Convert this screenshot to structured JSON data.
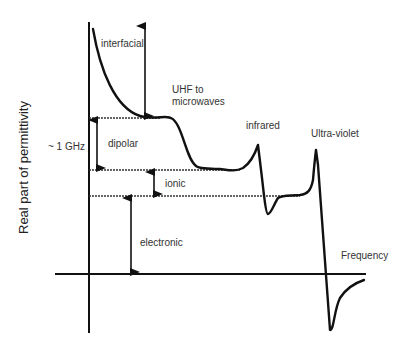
{
  "diagram": {
    "type": "dielectric-permittivity-spectrum",
    "y_axis_label": "Real part of permittivity",
    "x_axis_label": "Frequency",
    "marker_label": "~ 1 GHz",
    "regions": [
      {
        "name": "interfacial",
        "label": "interfacial"
      },
      {
        "name": "dipolar",
        "label": "dipolar"
      },
      {
        "name": "ionic",
        "label": "ionic"
      },
      {
        "name": "electronic",
        "label": "electronic"
      }
    ],
    "band_labels": {
      "uhf": "UHF to microwaves",
      "uhf_line1": "UHF to",
      "uhf_line2": "microwaves",
      "infrared": "infrared",
      "ultraviolet": "Ultra-violet"
    },
    "colors": {
      "line": "#111111",
      "text": "#333333",
      "background": "#ffffff"
    }
  }
}
